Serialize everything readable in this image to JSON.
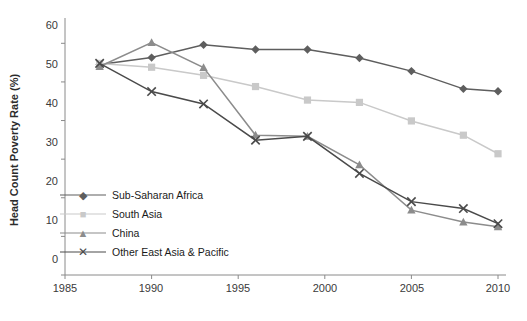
{
  "chart_data": {
    "type": "line",
    "title": "",
    "xlabel": "",
    "ylabel": "Head Count Poverty Rate (%)",
    "xlim": [
      1985,
      2010
    ],
    "ylim": [
      0,
      65
    ],
    "xticks": [
      1985,
      1990,
      1995,
      2000,
      2005,
      2010
    ],
    "yticks": [
      0,
      10,
      20,
      30,
      40,
      50,
      60
    ],
    "grid": false,
    "legend_position": "inside-lower-left",
    "series": [
      {
        "name": "Sub-Saharan Africa",
        "color": "#5e5e5e",
        "marker": "diamond",
        "x": [
          1987,
          1990,
          1993,
          1996,
          1999,
          2002,
          2005,
          2008,
          2010
        ],
        "values": [
          54.5,
          56.3,
          59.6,
          58.4,
          58.4,
          56.2,
          52.8,
          48.2,
          47.6
        ]
      },
      {
        "name": "South Asia",
        "color": "#c9c9c9",
        "marker": "square",
        "x": [
          1987,
          1990,
          1993,
          1996,
          1999,
          2002,
          2005,
          2008,
          2010
        ],
        "values": [
          54.8,
          53.8,
          51.7,
          48.8,
          45.3,
          44.7,
          39.9,
          36.2,
          31.4
        ]
      },
      {
        "name": "China",
        "color": "#8c8c8c",
        "marker": "triangle",
        "x": [
          1987,
          1990,
          1993,
          1996,
          1999,
          2002,
          2005,
          2008,
          2010
        ],
        "values": [
          54.0,
          60.2,
          53.7,
          36.2,
          35.9,
          28.5,
          16.8,
          13.7,
          12.5
        ]
      },
      {
        "name": "Other East Asia & Pacific",
        "color": "#4a4a4a",
        "marker": "cross",
        "x": [
          1987,
          1990,
          1993,
          1996,
          1999,
          2002,
          2005,
          2008,
          2010
        ],
        "values": [
          54.8,
          47.5,
          44.3,
          34.9,
          35.9,
          26.3,
          19.0,
          17.2,
          13.3
        ]
      }
    ]
  },
  "axes": {
    "y_title": "Head Count Poverty Rate (%)",
    "y_labels": [
      "0",
      "10",
      "20",
      "30",
      "40",
      "50",
      "60"
    ],
    "x_labels": [
      "1985",
      "1990",
      "1995",
      "2000",
      "2005",
      "2010"
    ]
  },
  "legend": [
    {
      "label": "Sub-Saharan Africa",
      "color": "#5e5e5e",
      "marker": "diamond"
    },
    {
      "label": "South Asia",
      "color": "#c9c9c9",
      "marker": "square"
    },
    {
      "label": "China",
      "color": "#8c8c8c",
      "marker": "triangle"
    },
    {
      "label": "Other East Asia & Pacific",
      "color": "#4a4a4a",
      "marker": "cross"
    }
  ]
}
